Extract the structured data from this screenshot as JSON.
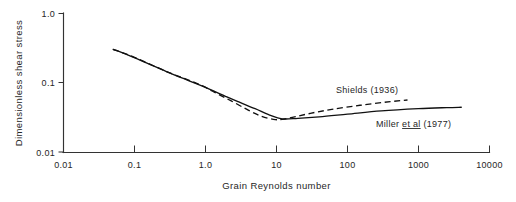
{
  "figure": {
    "name": "shields-miller-threshold-curve",
    "background_color": "#ffffff",
    "ink_color": "#111111"
  },
  "chart_data": {
    "type": "line",
    "title": "",
    "xlabel": "Grain Reynolds number",
    "ylabel": "Dimensionless shear stress",
    "xscale": "log",
    "yscale": "log",
    "xlim": [
      0.01,
      10000
    ],
    "ylim": [
      0.01,
      1.0
    ],
    "grid": false,
    "legend_position": "inline-annotation",
    "xticks": [
      0.01,
      0.1,
      1.0,
      10,
      100,
      1000,
      10000
    ],
    "xtick_labels": [
      "0.01",
      "0.1",
      "1.0",
      "10",
      "100",
      "1000",
      "10000"
    ],
    "yticks": [
      0.01,
      0.1,
      1.0
    ],
    "ytick_labels": [
      "0.01",
      "0.1",
      "1.0"
    ],
    "series": [
      {
        "name": "Miller et al (1977)",
        "style": "solid",
        "label": "Miller et al (1977)",
        "label_parts": {
          "lead": "Miller ",
          "underlined": "et al",
          "trail": " (1977)"
        },
        "x": [
          0.05,
          0.08,
          0.15,
          0.3,
          0.6,
          1.0,
          2.0,
          3.0,
          5.0,
          8.0,
          12.0,
          20.0,
          40.0,
          100.0,
          300.0,
          1000.0,
          2500.0,
          4000.0
        ],
        "y": [
          0.3,
          0.25,
          0.19,
          0.14,
          0.105,
          0.085,
          0.062,
          0.052,
          0.042,
          0.034,
          0.03,
          0.0305,
          0.032,
          0.035,
          0.039,
          0.042,
          0.0435,
          0.044
        ]
      },
      {
        "name": "Shields (1936)",
        "style": "dashed",
        "label": "Shields (1936)",
        "x": [
          0.05,
          0.1,
          0.3,
          0.8,
          1.5,
          2.5,
          4.0,
          6.0,
          9.0,
          12.0,
          18.0,
          30.0,
          60.0,
          150.0,
          400.0,
          700.0
        ],
        "y": [
          0.3,
          0.23,
          0.14,
          0.095,
          0.068,
          0.052,
          0.04,
          0.033,
          0.0295,
          0.0295,
          0.032,
          0.036,
          0.041,
          0.047,
          0.053,
          0.056
        ]
      }
    ],
    "annotations": [
      {
        "name": "shields-annotation",
        "text": "Shields (1936)",
        "x_px": 336,
        "y_px": 93
      },
      {
        "name": "miller-annotation",
        "text": "Miller et al (1977)",
        "x_px": 376,
        "y_px": 127
      }
    ]
  },
  "axes": {
    "y_axis_title": "Dimensionless shear stress",
    "x_axis_title": "Grain Reynolds number"
  }
}
